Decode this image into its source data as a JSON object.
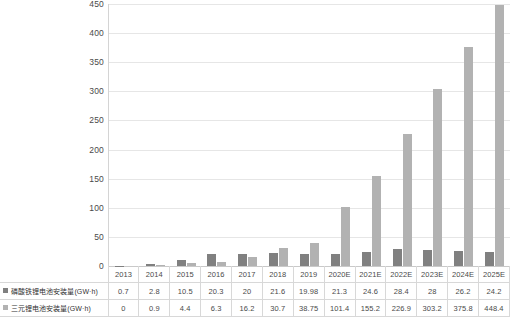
{
  "chart_data": {
    "type": "bar",
    "title": "",
    "xlabel": "",
    "ylabel": "",
    "ylim": [
      0,
      450
    ],
    "ytick_step": 50,
    "yticks": [
      "0",
      "50",
      "100",
      "150",
      "200",
      "250",
      "300",
      "350",
      "400",
      "450"
    ],
    "grid": true,
    "legend_position": "table-row-labels",
    "categories": [
      "2013",
      "2014",
      "2015",
      "2016",
      "2017",
      "2018",
      "2019",
      "2020E",
      "2021E",
      "2022E",
      "2023E",
      "2024E",
      "2025E"
    ],
    "series": [
      {
        "name": "磷酸铁锂电池安装量(GW·h)",
        "color": "#808080",
        "values": [
          0.7,
          2.8,
          10.5,
          20.3,
          20,
          21.6,
          19.98,
          21.3,
          24.6,
          28.4,
          28,
          26.2,
          24.2
        ],
        "labels": [
          "0.7",
          "2.8",
          "10.5",
          "20.3",
          "20",
          "21.6",
          "19.98",
          "21.3",
          "24.6",
          "28.4",
          "28",
          "26.2",
          "24.2"
        ]
      },
      {
        "name": "三元锂电池安装量(GW·h)",
        "color": "#b2b2b2",
        "values": [
          0,
          0.9,
          4.4,
          6.3,
          16.2,
          30.7,
          38.75,
          101.4,
          155.2,
          226.9,
          303.2,
          375.8,
          448.4
        ],
        "labels": [
          "0",
          "0.9",
          "4.4",
          "6.3",
          "16.2",
          "30.7",
          "38.75",
          "101.4",
          "155.2",
          "226.9",
          "303.2",
          "375.8",
          "448.4"
        ]
      }
    ]
  }
}
